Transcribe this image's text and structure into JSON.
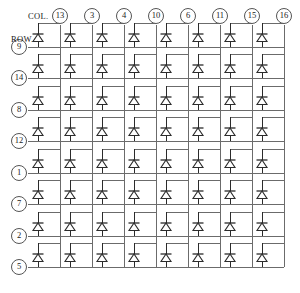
{
  "diagram": {
    "type": "diode-matrix-schematic",
    "col_caption": "COL.",
    "row_caption": "ROW.",
    "columns": [
      "13",
      "3",
      "4",
      "10",
      "6",
      "11",
      "15",
      "16"
    ],
    "rows": [
      "9",
      "14",
      "8",
      "12",
      "1",
      "7",
      "2",
      "5"
    ],
    "cell_component": "diode",
    "cell_count": 64,
    "colors": {
      "wire": "#6b6b6b",
      "component": "#2b2b2b",
      "node_outline": "#555555",
      "background": "#ffffff"
    },
    "geometry": {
      "col_x": [
        60,
        92,
        124,
        156,
        188,
        220,
        252,
        284
      ],
      "row_y": [
        47,
        78,
        110,
        141,
        173,
        204,
        236,
        267
      ],
      "node_radius": 7.5,
      "col_label_y": 16,
      "cell_stub_dx": -22
    }
  }
}
